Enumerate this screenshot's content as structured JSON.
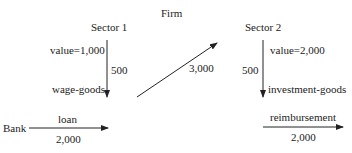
{
  "title": "Firm",
  "sector1": {
    "name": "Sector 1",
    "value_label": "value=1,000",
    "flow_amount": "500",
    "flow_label": "wage-goods"
  },
  "sector2": {
    "name": "Sector 2",
    "value_label": "value=2,000",
    "flow_amount": "500",
    "flow_label": "investment-goods"
  },
  "transfer": {
    "amount": "3,000"
  },
  "bank": {
    "name": "Bank",
    "loan_label": "loan",
    "loan_amount": "2,000",
    "reimbursement_label": "reimbursement",
    "reimbursement_amount": "2,000"
  },
  "colors": {
    "line": "#222222",
    "text": "#222222",
    "background": "#ffffff"
  }
}
